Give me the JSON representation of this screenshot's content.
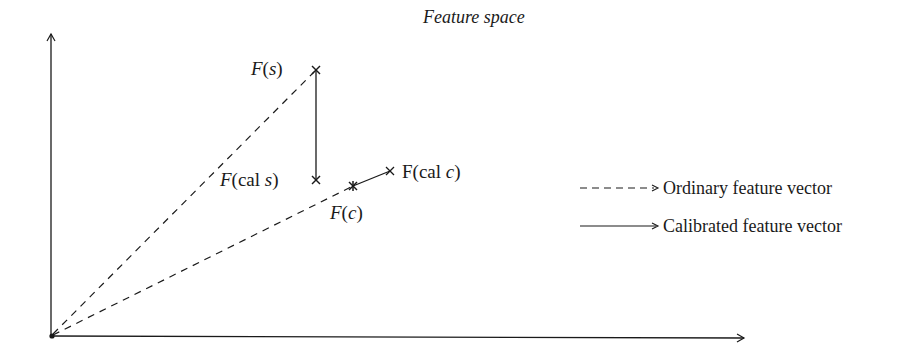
{
  "title": "Feature space",
  "points": {
    "fs": {
      "label_pre": "F",
      "label_arg": "(s)",
      "x": 316,
      "y": 70
    },
    "fcals": {
      "label_pre": "F",
      "label_arg": "(cal s)",
      "x": 316,
      "y": 180
    },
    "fc": {
      "label_pre": "F",
      "label_arg": "(c)",
      "x": 353,
      "y": 186
    },
    "fcalc": {
      "label_pre": "F(cal ",
      "label_var": "c",
      "label_post": ")",
      "x": 390,
      "y": 171
    }
  },
  "labels": {
    "fs": {
      "F": "F",
      "paren_open": "(",
      "var": "s",
      "paren_close": ")"
    },
    "fcals": {
      "F": "F",
      "rest_open": "(cal ",
      "var": "s",
      "paren_close": ")"
    },
    "fc": {
      "F": "F",
      "paren_open": "(",
      "var": "c",
      "paren_close": ")"
    },
    "fcalc": {
      "prefix": "F(cal ",
      "var": "c",
      "paren_close": ")"
    }
  },
  "legend": {
    "items": [
      {
        "style": "dashed",
        "label": "Ordinary feature vector"
      },
      {
        "style": "solid",
        "label": "Calibrated feature vector"
      }
    ]
  },
  "colors": {
    "ink": "#1a1a1a",
    "background": "#ffffff"
  }
}
